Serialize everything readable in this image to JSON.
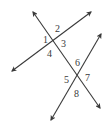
{
  "diagram": {
    "colors": {
      "line": "#3a3a3a",
      "label": "#3a3a3a",
      "background": "#ffffff"
    },
    "lines": [
      {
        "id": "line-a",
        "name": "upper-line",
        "x1": 12,
        "y1": 71,
        "x2": 91,
        "y2": 12
      },
      {
        "id": "transversal",
        "name": "transversal",
        "x1": 33,
        "y1": 12,
        "x2": 100,
        "y2": 108
      },
      {
        "id": "line-b",
        "name": "lower-line",
        "x1": 51,
        "y1": 120,
        "x2": 101,
        "y2": 34
      }
    ],
    "intersections": [
      {
        "id": "p1",
        "x": 52,
        "y": 42
      },
      {
        "id": "p2",
        "x": 77,
        "y": 77
      }
    ],
    "angles": [
      {
        "label": "1",
        "x": 43,
        "y": 43
      },
      {
        "label": "2",
        "x": 55,
        "y": 32
      },
      {
        "label": "3",
        "x": 61,
        "y": 47
      },
      {
        "label": "4",
        "x": 47,
        "y": 57
      },
      {
        "label": "6",
        "x": 75,
        "y": 66
      },
      {
        "label": "5",
        "x": 64,
        "y": 83
      },
      {
        "label": "7",
        "x": 85,
        "y": 81
      },
      {
        "label": "8",
        "x": 74,
        "y": 97
      }
    ]
  }
}
